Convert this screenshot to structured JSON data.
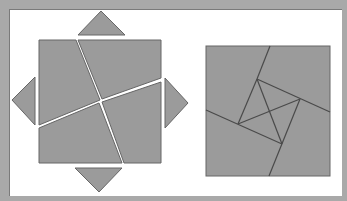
{
  "figure": {
    "colors": {
      "background": "#a9a9a9",
      "panel": "#ffffff",
      "piece_fill": "#9b9b9b",
      "piece_stroke": "#666666",
      "gap": "#ffffff"
    },
    "left_figure": {
      "pieces": [
        {
          "name": "top-left-quad",
          "points": "39,40 76,40 100,100 39,125"
        },
        {
          "name": "top-right-quad",
          "points": "78,40 161,40 161,78 102,99"
        },
        {
          "name": "bottom-right-quad",
          "points": "161,82 161,163 124,163 102,102"
        },
        {
          "name": "bottom-left-quad",
          "points": "39,128 99,103 122,163 39,163"
        },
        {
          "name": "top-triangle",
          "points": "78,35 101,11 125,35"
        },
        {
          "name": "left-triangle",
          "points": "35,77 35,125 12,100"
        },
        {
          "name": "right-triangle",
          "points": "165,78 165,128 188,103"
        },
        {
          "name": "bottom-triangle",
          "points": "75,168 122,168 99,192"
        }
      ]
    },
    "right_figure": {
      "square": {
        "x": 206,
        "y": 46,
        "w": 124,
        "h": 130
      },
      "inner_square": [
        "257,79",
        "300,99",
        "282,144",
        "238,124"
      ],
      "lines": [
        {
          "name": "cut-top",
          "x1": 270,
          "y1": 46,
          "x2": 257,
          "y2": 79
        },
        {
          "name": "cut-right",
          "x1": 257,
          "y1": 79,
          "x2": 330,
          "y2": 112
        },
        {
          "name": "cut-bottom",
          "x1": 300,
          "y1": 99,
          "x2": 269,
          "y2": 176
        },
        {
          "name": "cut-left",
          "x1": 206,
          "y1": 110,
          "x2": 282,
          "y2": 144
        },
        {
          "name": "inner-left",
          "x1": 257,
          "y1": 79,
          "x2": 238,
          "y2": 124
        },
        {
          "name": "diagonal-1",
          "x1": 257,
          "y1": 79,
          "x2": 282,
          "y2": 144
        },
        {
          "name": "diagonal-2",
          "x1": 238,
          "y1": 124,
          "x2": 300,
          "y2": 99
        }
      ]
    }
  }
}
